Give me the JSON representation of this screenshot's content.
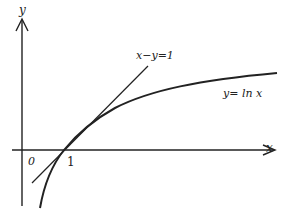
{
  "diagram": {
    "axes": {
      "x_label": "x",
      "y_label": "y",
      "origin_label": "0",
      "tick_label": "1"
    },
    "curve": {
      "label": "y= ln x",
      "equation": "y = ln x"
    },
    "tangent": {
      "label": "x−y=1",
      "equation": "x − y = 1",
      "tangent_point": "(1, 0)"
    },
    "colors": {
      "stroke": "#222222",
      "background": "#ffffff"
    }
  }
}
